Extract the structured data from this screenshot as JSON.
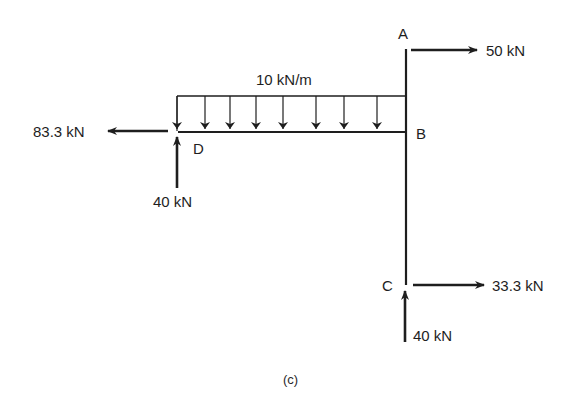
{
  "diagram": {
    "type": "free-body-diagram",
    "caption": "(c)",
    "colors": {
      "line": "#1e1e1e",
      "background": "#ffffff"
    },
    "nodes": [
      {
        "id": "A",
        "label": "A"
      },
      {
        "id": "B",
        "label": "B"
      },
      {
        "id": "C",
        "label": "C"
      },
      {
        "id": "D",
        "label": "D"
      }
    ],
    "members": [
      {
        "from": "A",
        "to": "C",
        "orientation": "vertical"
      },
      {
        "from": "D",
        "to": "B",
        "orientation": "horizontal"
      }
    ],
    "distributed_load": {
      "label": "10 kN/m",
      "on_member": "D-B",
      "direction": "down"
    },
    "forces": [
      {
        "at": "A",
        "direction": "right",
        "label": "50 kN"
      },
      {
        "at": "C",
        "direction": "right",
        "label": "33.3 kN"
      },
      {
        "at": "C",
        "direction": "up",
        "label": "40 kN"
      },
      {
        "at": "D",
        "direction": "left",
        "label": "83.3 kN"
      },
      {
        "at": "D",
        "direction": "up",
        "label": "40 kN"
      }
    ]
  }
}
